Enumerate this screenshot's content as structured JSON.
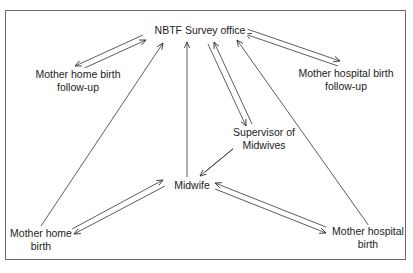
{
  "diagram": {
    "type": "flow",
    "colors": {
      "line": "#333333",
      "border": "#6b6b6b",
      "text": "#222222"
    },
    "nodes": {
      "survey_office": {
        "label": "NBTF Survey office"
      },
      "home_followup": {
        "line1": "Mother home birth",
        "line2": "follow-up"
      },
      "hospital_followup": {
        "line1": "Mother hospital birth",
        "line2": "follow-up"
      },
      "supervisor": {
        "line1": "Supervisor of",
        "line2": "Midwives"
      },
      "midwife": {
        "label": "Midwife"
      },
      "home_birth": {
        "line1": "Mother home",
        "line2": "birth"
      },
      "hospital_birth": {
        "line1": "Mother hospital",
        "line2": "birth"
      }
    },
    "edges": [
      {
        "from": "Mother home birth follow-up",
        "to": "NBTF Survey office",
        "bidirectional": true
      },
      {
        "from": "Mother home birth",
        "to": "NBTF Survey office",
        "bidirectional": false
      },
      {
        "from": "Midwife",
        "to": "NBTF Survey office",
        "bidirectional": false
      },
      {
        "from": "Supervisor of Midwives",
        "to": "NBTF Survey office",
        "bidirectional": true
      },
      {
        "from": "Mother hospital birth",
        "to": "NBTF Survey office",
        "bidirectional": false
      },
      {
        "from": "Mother hospital birth follow-up",
        "to": "NBTF Survey office",
        "bidirectional": true
      },
      {
        "from": "Midwife",
        "to": "Supervisor of Midwives",
        "bidirectional": true
      },
      {
        "from": "Midwife",
        "to": "Mother home birth",
        "bidirectional": true
      },
      {
        "from": "Midwife",
        "to": "Mother hospital birth",
        "bidirectional": true
      }
    ]
  }
}
